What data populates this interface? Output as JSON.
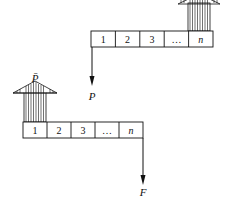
{
  "upper_strip": {
    "cells": [
      "1",
      "2",
      "3",
      "…",
      "n"
    ],
    "point_force_label": "P",
    "distributed_load": "upward hatched arrow over cell n"
  },
  "lower_strip": {
    "cells": [
      "1",
      "2",
      "3",
      "…",
      "n"
    ],
    "distributed_load_label": "P̄",
    "point_force_label": "F"
  },
  "colors": {
    "stroke": "#111111",
    "background": "#ffffff"
  }
}
